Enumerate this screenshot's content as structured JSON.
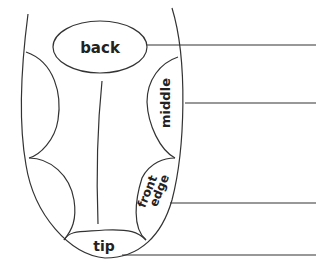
{
  "diagram": {
    "stroke_color": "#333333",
    "background": "#ffffff",
    "regions": [
      {
        "id": "back",
        "label": "back"
      },
      {
        "id": "middle",
        "label": "middle"
      },
      {
        "id": "front-edge",
        "label_line1": "front",
        "label_line2": "edge"
      },
      {
        "id": "tip",
        "label": "tip"
      }
    ],
    "leader_lines": [
      {
        "region": "back",
        "y": 45
      },
      {
        "region": "middle",
        "y": 103
      },
      {
        "region": "front-edge",
        "y": 203
      },
      {
        "region": "tip",
        "y": 255
      }
    ]
  }
}
